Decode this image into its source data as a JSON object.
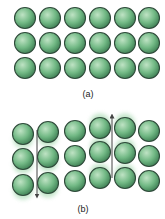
{
  "figure": {
    "panels": [
      {
        "id": "a",
        "caption": "(a)",
        "caption_pos": [
          88,
          90
        ],
        "description": "Atoms at rest in a regular lattice",
        "atoms": [
          {
            "x": 25,
            "y": 18,
            "blur": 0
          },
          {
            "x": 50,
            "y": 18,
            "blur": 0
          },
          {
            "x": 75,
            "y": 18,
            "blur": 0
          },
          {
            "x": 100,
            "y": 18,
            "blur": 0
          },
          {
            "x": 125,
            "y": 18,
            "blur": 0
          },
          {
            "x": 149,
            "y": 18,
            "blur": 0
          },
          {
            "x": 25,
            "y": 43,
            "blur": 0
          },
          {
            "x": 50,
            "y": 43,
            "blur": 0
          },
          {
            "x": 75,
            "y": 43,
            "blur": 0
          },
          {
            "x": 100,
            "y": 43,
            "blur": 0
          },
          {
            "x": 125,
            "y": 43,
            "blur": 0
          },
          {
            "x": 149,
            "y": 43,
            "blur": 0
          },
          {
            "x": 25,
            "y": 68,
            "blur": 0
          },
          {
            "x": 50,
            "y": 68,
            "blur": 0
          },
          {
            "x": 75,
            "y": 68,
            "blur": 0
          },
          {
            "x": 100,
            "y": 68,
            "blur": 0
          },
          {
            "x": 125,
            "y": 68,
            "blur": 0
          },
          {
            "x": 149,
            "y": 68,
            "blur": 0
          }
        ],
        "arrows": []
      },
      {
        "id": "b",
        "caption": "(b)",
        "caption_pos": [
          83,
          205
        ],
        "description": "Atoms displaced by a transverse wave (motion blur)",
        "atoms": [
          {
            "x": 23,
            "y": 134,
            "blur": -1
          },
          {
            "x": 48,
            "y": 132,
            "blur": -1
          },
          {
            "x": 75,
            "y": 131,
            "blur": 0
          },
          {
            "x": 100,
            "y": 128,
            "blur": 1
          },
          {
            "x": 125,
            "y": 128,
            "blur": 1
          },
          {
            "x": 149,
            "y": 131,
            "blur": 0
          },
          {
            "x": 23,
            "y": 159,
            "blur": -1
          },
          {
            "x": 48,
            "y": 157,
            "blur": -1
          },
          {
            "x": 75,
            "y": 156,
            "blur": 0
          },
          {
            "x": 100,
            "y": 152,
            "blur": 1
          },
          {
            "x": 125,
            "y": 153,
            "blur": 1
          },
          {
            "x": 149,
            "y": 156,
            "blur": 0
          },
          {
            "x": 23,
            "y": 185,
            "blur": -1
          },
          {
            "x": 48,
            "y": 183,
            "blur": -1
          },
          {
            "x": 75,
            "y": 181,
            "blur": 0
          },
          {
            "x": 100,
            "y": 178,
            "blur": 1
          },
          {
            "x": 125,
            "y": 178,
            "blur": 1
          },
          {
            "x": 149,
            "y": 181,
            "blur": 0
          }
        ],
        "arrows": [
          {
            "direction": "down",
            "x": 37,
            "y1": 130,
            "y2": 196
          },
          {
            "direction": "up",
            "x": 112,
            "y1": 178,
            "y2": 116
          }
        ]
      }
    ],
    "atom_radius": 10.5,
    "colors": {
      "highlight": "#bfe3c4",
      "mid": "#72b985",
      "edge": "#3c7d52",
      "outline": "#2f4a3a",
      "trail": "#8fcf9c",
      "arrow": "#444444"
    }
  }
}
